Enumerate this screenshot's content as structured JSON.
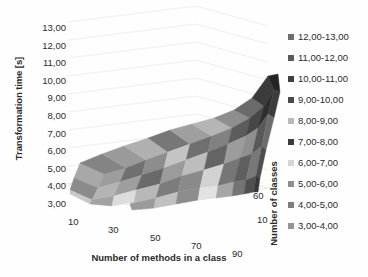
{
  "chart_data": {
    "type": "surface",
    "title": "",
    "xlabel": "Number of methods in a class",
    "ylabel": "Transformation time [s]",
    "zlabel": "Number of classes",
    "ylim": [
      3.0,
      13.0
    ],
    "ytick_labels": [
      "13,00",
      "12,00",
      "11,00",
      "10,00",
      "9,00",
      "8,00",
      "7,00",
      "6,00",
      "5,00",
      "4,00",
      "3,00"
    ],
    "ytick_values": [
      13,
      12,
      11,
      10,
      9,
      8,
      7,
      6,
      5,
      4,
      3
    ],
    "xtick_labels": [
      "10",
      "30",
      "50",
      "70",
      "90"
    ],
    "xtick_values": [
      10,
      30,
      50,
      70,
      90
    ],
    "ztick_labels": [
      "60",
      "10"
    ],
    "ztick_values": [
      60,
      10
    ],
    "grid": true,
    "legend_position": "right",
    "legend_title": "",
    "bands": [
      {
        "label": "12,00-13,00",
        "color": "#6e6e6e",
        "range": [
          12,
          13
        ]
      },
      {
        "label": "11,00-12,00",
        "color": "#5a5a5a",
        "range": [
          11,
          12
        ]
      },
      {
        "label": "10,00-11,00",
        "color": "#3f3f3f",
        "range": [
          10,
          11
        ]
      },
      {
        "label": "9,00-10,00",
        "color": "#4a4a4a",
        "range": [
          9,
          10
        ]
      },
      {
        "label": "8,00-9,00",
        "color": "#b9b9b9",
        "range": [
          8,
          9
        ]
      },
      {
        "label": "7,00-8,00",
        "color": "#3a3a3a",
        "range": [
          7,
          8
        ]
      },
      {
        "label": "6,00-7,00",
        "color": "#d6d6d6",
        "range": [
          6,
          7
        ]
      },
      {
        "label": "5,00-6,00",
        "color": "#8f8f8f",
        "range": [
          5,
          6
        ]
      },
      {
        "label": "4,00-5,00",
        "color": "#7e7e7e",
        "range": [
          4,
          5
        ]
      },
      {
        "label": "3,00-4,00",
        "color": "#949494",
        "range": [
          3,
          4
        ]
      }
    ],
    "x": [
      10,
      30,
      50,
      70,
      90
    ],
    "z": [
      10,
      20,
      30,
      40,
      50,
      60
    ],
    "series": [
      {
        "name": "classes=10",
        "values": [
          4.9,
          5.0,
          5.1,
          5.2,
          5.3
        ]
      },
      {
        "name": "classes=20",
        "values": [
          5.0,
          5.2,
          5.4,
          5.6,
          6.0
        ]
      },
      {
        "name": "classes=30",
        "values": [
          5.1,
          5.5,
          5.9,
          6.4,
          7.0
        ]
      },
      {
        "name": "classes=40",
        "values": [
          5.3,
          5.9,
          6.6,
          7.4,
          8.2
        ]
      },
      {
        "name": "classes=50",
        "values": [
          5.5,
          6.3,
          7.3,
          8.4,
          9.4
        ]
      },
      {
        "name": "classes=60",
        "values": [
          5.8,
          6.8,
          8.1,
          9.5,
          11.0
        ]
      }
    ],
    "surface_facets": [
      {
        "points": "12,145 36,156 30,170 6,160",
        "color": "#a8a8a8"
      },
      {
        "points": "6,160 30,170 24,182 2,172",
        "color": "#8b8b8b"
      },
      {
        "points": "36,156 58,150 52,164 30,170",
        "color": "#9d9d9d"
      },
      {
        "points": "30,170 52,164 46,178 24,182",
        "color": "#b4b4b4"
      },
      {
        "points": "12,145 34,136 58,150 36,156",
        "color": "#848484"
      },
      {
        "points": "34,136 56,128 78,142 58,150",
        "color": "#9a9a9a"
      },
      {
        "points": "58,150 78,142 74,157 52,164",
        "color": "#707070"
      },
      {
        "points": "52,164 74,157 68,172 46,178",
        "color": "#9e9e9e"
      },
      {
        "points": "56,128 80,120 100,134 78,142",
        "color": "#b0b0b0"
      },
      {
        "points": "78,142 100,134 96,150 74,157",
        "color": "#8d8d8d"
      },
      {
        "points": "74,157 96,150 92,166 68,172",
        "color": "#6a6a6a"
      },
      {
        "points": "68,172 92,166 88,180 62,186",
        "color": "#b8b8b8"
      },
      {
        "points": "80,120 102,112 122,126 100,134",
        "color": "#777777"
      },
      {
        "points": "100,134 122,126 118,142 96,150",
        "color": "#c4c4c4"
      },
      {
        "points": "96,150 118,142 114,158 92,166",
        "color": "#9b9b9b"
      },
      {
        "points": "92,166 114,158 110,174 88,180",
        "color": "#7c7c7c"
      },
      {
        "points": "102,112 124,106 144,118 122,126",
        "color": "#9f9f9f"
      },
      {
        "points": "122,126 144,118 140,134 118,142",
        "color": "#6f6f6f"
      },
      {
        "points": "118,142 140,134 136,152 114,158",
        "color": "#bdbdbd"
      },
      {
        "points": "114,158 136,152 132,170 110,174",
        "color": "#8a8a8a"
      },
      {
        "points": "124,106 146,100 164,110 144,118",
        "color": "#b5b5b5"
      },
      {
        "points": "144,118 164,110 160,126 140,134",
        "color": "#818181"
      },
      {
        "points": "140,134 160,126 156,146 136,152",
        "color": "#646464"
      },
      {
        "points": "136,152 156,146 150,168 132,170",
        "color": "#d2d2d2"
      },
      {
        "points": "146,100 166,92 182,100 164,110",
        "color": "#8e8e8e"
      },
      {
        "points": "164,110 182,100 178,118 160,126",
        "color": "#5c5c5c"
      },
      {
        "points": "160,126 178,118 172,140 156,146",
        "color": "#9c9c9c"
      },
      {
        "points": "156,146 172,140 166,164 150,168",
        "color": "#767676"
      },
      {
        "points": "166,92 184,80 196,88 182,100",
        "color": "#6b6b6b"
      },
      {
        "points": "182,100 196,88 190,110 178,118",
        "color": "#474747"
      },
      {
        "points": "178,118 190,110 184,136 172,140",
        "color": "#8f8f8f"
      },
      {
        "points": "172,140 184,136 178,162 166,164",
        "color": "#5f5f5f"
      },
      {
        "points": "184,80 200,58 206,72 196,88",
        "color": "#3b3b3b"
      },
      {
        "points": "196,88 206,72 200,96 190,110",
        "color": "#2e2e2e"
      },
      {
        "points": "190,110 200,96 194,128 184,136",
        "color": "#595959"
      },
      {
        "points": "184,136 194,128 188,158 178,162",
        "color": "#787878"
      },
      {
        "points": "200,58 210,56 212,74 206,72",
        "color": "#242424"
      },
      {
        "points": "206,72 212,74 206,100 200,96",
        "color": "#3c3c3c"
      },
      {
        "points": "200,96 206,100 198,132 194,128",
        "color": "#6c6c6c"
      },
      {
        "points": "194,128 198,132 192,160 188,158",
        "color": "#4e4e4e"
      },
      {
        "points": "2,172 24,182 22,186 2,176",
        "color": "#c8c8c8"
      },
      {
        "points": "24,182 46,178 44,188 22,186",
        "color": "#a2a2a2"
      },
      {
        "points": "46,178 68,172 66,184 44,188",
        "color": "#dcdcdc"
      },
      {
        "points": "62,186 88,180 86,190 64,192",
        "color": "#9a9a9a"
      },
      {
        "points": "88,180 110,174 108,186 86,190",
        "color": "#c0c0c0"
      },
      {
        "points": "110,174 132,170 130,182 108,186",
        "color": "#8c8c8c"
      },
      {
        "points": "132,170 150,168 148,180 130,182",
        "color": "#e2e2e2"
      },
      {
        "points": "150,168 166,164 164,178 148,180",
        "color": "#a6a6a6"
      },
      {
        "points": "166,164 178,162 176,176 164,178",
        "color": "#747474"
      },
      {
        "points": "178,162 188,158 186,174 176,176",
        "color": "#505050"
      },
      {
        "points": "188,158 192,160 190,174 186,174",
        "color": "#383838"
      }
    ]
  }
}
